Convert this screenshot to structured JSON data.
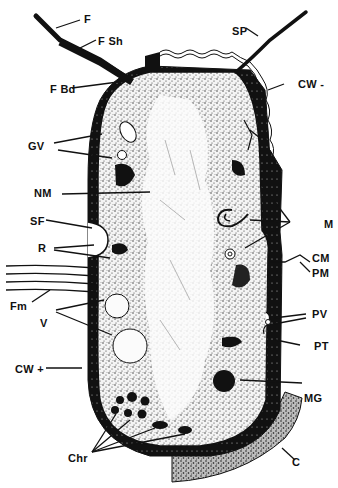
{
  "figure": {
    "colors": {
      "ink": "#111111",
      "background": "#ffffff",
      "cytoplasm_stipple": "#333333"
    }
  },
  "labels": {
    "F": "F",
    "F_Sh": "F Sh",
    "F_Bd": "F Bd",
    "SP": "SP",
    "CW_minus": "CW -",
    "GV": "GV",
    "NM": "NM",
    "SF": "SF",
    "R": "R",
    "M": "M",
    "CM": "CM",
    "PM": "PM",
    "Fm": "Fm",
    "V": "V",
    "PV": "PV",
    "PT": "PT",
    "CW_plus": "CW +",
    "MG": "MG",
    "Chr": "Chr",
    "C": "C"
  }
}
